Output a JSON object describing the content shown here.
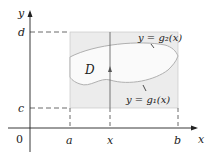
{
  "figure": {
    "type": "type-I/type-II region diagram",
    "axes": {
      "x_label": "x",
      "y_label": "y",
      "origin_label": "0"
    },
    "tick_labels": {
      "x": [
        "a",
        "x",
        "b"
      ],
      "y": [
        "c",
        "d"
      ]
    },
    "labels": {
      "a": "a",
      "x": "x",
      "b": "b",
      "c": "c",
      "d": "d",
      "region": "D",
      "upper_curve": "y = g₂(x)",
      "lower_curve": "y = g₁(x)"
    },
    "colors": {
      "rectangle_fill": "#ececec",
      "region_fill": "#fafafa",
      "curve": "#b0b0b0",
      "axis": "#222222",
      "dashed": "#444444"
    }
  }
}
